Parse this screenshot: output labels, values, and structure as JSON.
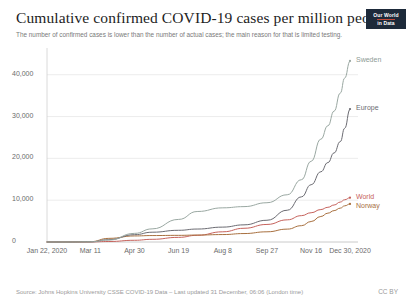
{
  "header": {
    "title": "Cumulative confirmed COVID-19 cases per million people",
    "subtitle": "The number of confirmed cases is lower than the number of actual cases; the main reason for that is limited testing."
  },
  "logo": {
    "line1": "Our World",
    "line2": "in Data"
  },
  "footer": {
    "source": "Source: Johns Hopkins University CSSE COVID-19 Data – Last updated 31 December, 06:06 (London time)",
    "license": "CC BY"
  },
  "chart_data": {
    "type": "line",
    "title": "Cumulative confirmed COVID-19 cases per million people",
    "subtitle": "The number of confirmed cases is lower than the number of actual cases; the main reason for that is limited testing.",
    "xlabel": "",
    "ylabel": "",
    "ylim": [
      0,
      44000
    ],
    "yticks": [
      0,
      10000,
      20000,
      30000,
      40000
    ],
    "ytick_labels": [
      "0",
      "10,000",
      "20,000",
      "30,000",
      "40,000"
    ],
    "grid": true,
    "legend_position": "right-inline-labels",
    "x_axis_type": "date",
    "xlim": [
      "2020-01-22",
      "2020-12-30"
    ],
    "xticks": [
      "2020-01-22",
      "2020-03-11",
      "2020-04-30",
      "2020-06-19",
      "2020-08-08",
      "2020-09-27",
      "2020-11-16",
      "2020-12-30"
    ],
    "xtick_labels": [
      "Jan 22, 2020",
      "Mar 11",
      "Apr 30",
      "Jun 19",
      "Aug 8",
      "Sep 27",
      "Nov 16",
      "Dec 30, 2020"
    ],
    "series": [
      {
        "name": "Sweden",
        "color": "#9aa8a2",
        "label_color": "#8d9b95",
        "final_value": 43300,
        "x": [
          "2020-01-22",
          "2020-02-16",
          "2020-03-11",
          "2020-04-01",
          "2020-04-30",
          "2020-05-20",
          "2020-06-19",
          "2020-07-10",
          "2020-08-08",
          "2020-09-01",
          "2020-09-27",
          "2020-10-20",
          "2020-11-05",
          "2020-11-16",
          "2020-11-27",
          "2020-12-05",
          "2020-12-12",
          "2020-12-19",
          "2020-12-24",
          "2020-12-30"
        ],
        "values": [
          0,
          2,
          50,
          460,
          2060,
          3140,
          5400,
          7290,
          8170,
          8460,
          9390,
          11300,
          14900,
          19300,
          24600,
          27800,
          31300,
          35600,
          39200,
          43300
        ]
      },
      {
        "name": "Europe",
        "color": "#6b6b72",
        "label_color": "#6b6b72",
        "final_value": 31800,
        "x": [
          "2020-01-22",
          "2020-02-16",
          "2020-03-11",
          "2020-04-01",
          "2020-04-30",
          "2020-05-20",
          "2020-06-19",
          "2020-07-10",
          "2020-08-08",
          "2020-09-01",
          "2020-09-27",
          "2020-10-20",
          "2020-11-05",
          "2020-11-16",
          "2020-11-27",
          "2020-12-05",
          "2020-12-12",
          "2020-12-19",
          "2020-12-24",
          "2020-12-30"
        ],
        "values": [
          0,
          1,
          30,
          560,
          1750,
          2340,
          2800,
          3100,
          3560,
          4100,
          5200,
          7600,
          10800,
          13700,
          16800,
          19000,
          21300,
          24000,
          27200,
          31800
        ]
      },
      {
        "name": "World",
        "color": "#c6625c",
        "label_color": "#c6625c",
        "final_value": 10600,
        "x": [
          "2020-01-22",
          "2020-02-16",
          "2020-03-11",
          "2020-04-01",
          "2020-04-30",
          "2020-05-20",
          "2020-06-19",
          "2020-07-10",
          "2020-08-08",
          "2020-09-01",
          "2020-09-27",
          "2020-10-20",
          "2020-11-05",
          "2020-11-16",
          "2020-11-27",
          "2020-12-05",
          "2020-12-12",
          "2020-12-19",
          "2020-12-24",
          "2020-12-30"
        ],
        "values": [
          0,
          9,
          17,
          120,
          410,
          640,
          1110,
          1600,
          2440,
          3280,
          4200,
          5300,
          6300,
          7000,
          7760,
          8300,
          8850,
          9550,
          10100,
          10600
        ]
      },
      {
        "name": "Norway",
        "color": "#a8703f",
        "label_color": "#a8703f",
        "final_value": 9100,
        "x": [
          "2020-01-22",
          "2020-02-16",
          "2020-03-11",
          "2020-04-01",
          "2020-04-30",
          "2020-05-20",
          "2020-06-19",
          "2020-07-10",
          "2020-08-08",
          "2020-09-01",
          "2020-09-27",
          "2020-10-20",
          "2020-11-05",
          "2020-11-16",
          "2020-11-27",
          "2020-12-05",
          "2020-12-12",
          "2020-12-19",
          "2020-12-24",
          "2020-12-30"
        ],
        "values": [
          0,
          0,
          75,
          870,
          1450,
          1540,
          1590,
          1660,
          1780,
          2020,
          2440,
          3080,
          3900,
          4900,
          6100,
          6900,
          7500,
          8100,
          8650,
          9100
        ]
      }
    ]
  }
}
